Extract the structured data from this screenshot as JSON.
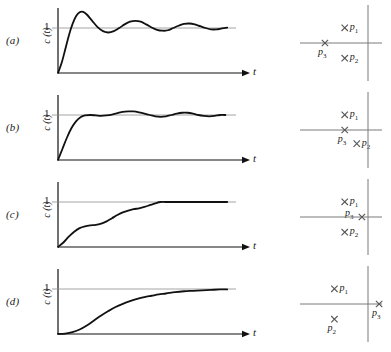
{
  "figure": {
    "axis_labels": {
      "y_axis": "c (t)",
      "x_axis": "t",
      "y_tick": "1"
    },
    "rows": [
      {
        "label": "(a)",
        "response_type": "underdamped-oscillatory",
        "description": "Damped oscillatory step response with large overshoot and slowly decaying ripple settling to 1",
        "poles": [
          {
            "name": "p1",
            "label": "p",
            "subscript": "1",
            "x_pct": 52,
            "y_pct": 30,
            "label_side": "right"
          },
          {
            "name": "p2",
            "label": "p",
            "subscript": "2",
            "x_pct": 52,
            "y_pct": 70,
            "label_side": "right"
          },
          {
            "name": "p3",
            "label": "p",
            "subscript": "3",
            "x_pct": 29,
            "y_pct": 50,
            "label_side": "below"
          }
        ]
      },
      {
        "label": "(b)",
        "response_type": "lightly-underdamped",
        "description": "Step response with small overshoot and small amplitude ripple settling to 1",
        "poles": [
          {
            "name": "p1",
            "label": "p",
            "subscript": "1",
            "x_pct": 52,
            "y_pct": 30,
            "label_side": "right"
          },
          {
            "name": "p2",
            "label": "p",
            "subscript": "2",
            "x_pct": 66,
            "y_pct": 68,
            "label_side": "right"
          },
          {
            "name": "p3",
            "label": "p",
            "subscript": "3",
            "x_pct": 52,
            "y_pct": 50,
            "label_side": "below"
          }
        ]
      },
      {
        "label": "(c)",
        "response_type": "overdamped-shelf",
        "description": "Monotonic staircase-like rise with an intermediate shelf, reaching 1 with no overshoot",
        "poles": [
          {
            "name": "p1",
            "label": "p",
            "subscript": "1",
            "x_pct": 52,
            "y_pct": 30,
            "label_side": "right"
          },
          {
            "name": "p2",
            "label": "p",
            "subscript": "2",
            "x_pct": 52,
            "y_pct": 70,
            "label_side": "right"
          },
          {
            "name": "p3",
            "label": "p",
            "subscript": "3",
            "x_pct": 72,
            "y_pct": 50,
            "label_side": "left"
          }
        ]
      },
      {
        "label": "(d)",
        "response_type": "dominant-real-pole",
        "description": "Slow S-shaped monotonic rise asymptotically approaching 1",
        "poles": [
          {
            "name": "p1",
            "label": "p",
            "subscript": "1",
            "x_pct": 40,
            "y_pct": 30,
            "label_side": "right"
          },
          {
            "name": "p2",
            "label": "p",
            "subscript": "2",
            "x_pct": 40,
            "y_pct": 70,
            "label_side": "below"
          },
          {
            "name": "p3",
            "label": "p",
            "subscript": "3",
            "x_pct": 92,
            "y_pct": 50,
            "label_side": "below"
          }
        ]
      }
    ]
  },
  "chart_data": {
    "type": "line",
    "xlabel": "t",
    "ylabel": "c (t)",
    "xlim": [
      0,
      10
    ],
    "ylim": [
      0,
      1.55
    ],
    "yticks": [
      1
    ],
    "ytick_labels": [
      "1"
    ],
    "grid": false,
    "reference_line": 1,
    "legend": "none",
    "series": [
      {
        "name": "(a)",
        "points": [
          [
            0.0,
            0.0
          ],
          [
            0.2,
            0.22
          ],
          [
            0.4,
            0.52
          ],
          [
            0.6,
            0.83
          ],
          [
            0.8,
            1.08
          ],
          [
            1.0,
            1.26
          ],
          [
            1.2,
            1.35
          ],
          [
            1.4,
            1.36
          ],
          [
            1.6,
            1.3
          ],
          [
            1.9,
            1.16
          ],
          [
            2.2,
            1.02
          ],
          [
            2.5,
            0.93
          ],
          [
            2.8,
            0.9
          ],
          [
            3.1,
            0.93
          ],
          [
            3.4,
            1.0
          ],
          [
            3.7,
            1.08
          ],
          [
            4.0,
            1.14
          ],
          [
            4.3,
            1.16
          ],
          [
            4.6,
            1.14
          ],
          [
            4.9,
            1.08
          ],
          [
            5.2,
            1.01
          ],
          [
            5.5,
            0.96
          ],
          [
            5.8,
            0.94
          ],
          [
            6.1,
            0.95
          ],
          [
            6.4,
            1.0
          ],
          [
            6.7,
            1.05
          ],
          [
            7.0,
            1.09
          ],
          [
            7.3,
            1.1
          ],
          [
            7.6,
            1.08
          ],
          [
            7.9,
            1.04
          ],
          [
            8.2,
            1.0
          ],
          [
            8.5,
            0.97
          ],
          [
            8.8,
            0.97
          ],
          [
            9.1,
            0.99
          ],
          [
            9.4,
            1.01
          ]
        ]
      },
      {
        "name": "(b)",
        "points": [
          [
            0.0,
            0.0
          ],
          [
            0.25,
            0.25
          ],
          [
            0.5,
            0.5
          ],
          [
            0.75,
            0.71
          ],
          [
            1.0,
            0.86
          ],
          [
            1.25,
            0.95
          ],
          [
            1.5,
            0.99
          ],
          [
            1.8,
            1.0
          ],
          [
            2.1,
            0.99
          ],
          [
            2.4,
            0.98
          ],
          [
            2.7,
            0.99
          ],
          [
            3.0,
            1.01
          ],
          [
            3.3,
            1.04
          ],
          [
            3.6,
            1.07
          ],
          [
            3.9,
            1.08
          ],
          [
            4.2,
            1.08
          ],
          [
            4.5,
            1.06
          ],
          [
            4.8,
            1.03
          ],
          [
            5.1,
            1.0
          ],
          [
            5.4,
            0.97
          ],
          [
            5.7,
            0.96
          ],
          [
            6.0,
            0.97
          ],
          [
            6.3,
            1.0
          ],
          [
            6.6,
            1.03
          ],
          [
            6.9,
            1.05
          ],
          [
            7.2,
            1.05
          ],
          [
            7.5,
            1.03
          ],
          [
            7.8,
            1.0
          ],
          [
            8.1,
            0.98
          ],
          [
            8.4,
            0.97
          ],
          [
            8.7,
            0.98
          ],
          [
            9.0,
            1.0
          ],
          [
            9.3,
            1.0
          ]
        ]
      },
      {
        "name": "(c)",
        "points": [
          [
            0.0,
            0.0
          ],
          [
            0.3,
            0.1
          ],
          [
            0.6,
            0.23
          ],
          [
            0.9,
            0.34
          ],
          [
            1.2,
            0.42
          ],
          [
            1.5,
            0.46
          ],
          [
            1.8,
            0.48
          ],
          [
            2.1,
            0.49
          ],
          [
            2.4,
            0.52
          ],
          [
            2.7,
            0.57
          ],
          [
            3.0,
            0.64
          ],
          [
            3.3,
            0.71
          ],
          [
            3.6,
            0.77
          ],
          [
            3.9,
            0.81
          ],
          [
            4.2,
            0.84
          ],
          [
            4.5,
            0.86
          ],
          [
            4.8,
            0.89
          ],
          [
            5.1,
            0.93
          ],
          [
            5.4,
            0.97
          ],
          [
            5.7,
            1.0
          ],
          [
            6.0,
            1.0
          ],
          [
            7.0,
            1.0
          ],
          [
            8.0,
            1.0
          ],
          [
            9.0,
            1.0
          ],
          [
            9.4,
            1.0
          ]
        ]
      },
      {
        "name": "(d)",
        "points": [
          [
            0.0,
            0.0
          ],
          [
            0.4,
            0.01
          ],
          [
            0.8,
            0.04
          ],
          [
            1.2,
            0.1
          ],
          [
            1.6,
            0.19
          ],
          [
            2.0,
            0.3
          ],
          [
            2.4,
            0.41
          ],
          [
            2.8,
            0.51
          ],
          [
            3.2,
            0.6
          ],
          [
            3.6,
            0.67
          ],
          [
            4.0,
            0.73
          ],
          [
            4.4,
            0.78
          ],
          [
            4.8,
            0.82
          ],
          [
            5.2,
            0.85
          ],
          [
            5.6,
            0.88
          ],
          [
            6.0,
            0.9
          ],
          [
            6.5,
            0.93
          ],
          [
            7.0,
            0.95
          ],
          [
            7.5,
            0.96
          ],
          [
            8.0,
            0.97
          ],
          [
            8.5,
            0.98
          ],
          [
            9.0,
            0.99
          ],
          [
            9.4,
            0.99
          ]
        ]
      }
    ]
  }
}
